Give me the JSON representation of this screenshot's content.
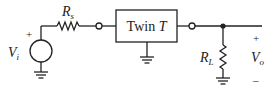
{
  "diagram": {
    "source": {
      "symbol": "V",
      "subscript": "i",
      "plus": "+"
    },
    "series_resistor": {
      "symbol": "R",
      "subscript": "s"
    },
    "block": {
      "label_text": "Twin ",
      "label_italic": "T"
    },
    "load_resistor": {
      "symbol": "R",
      "subscript": "L"
    },
    "output": {
      "symbol": "V",
      "subscript": "o",
      "plus": "+",
      "minus": "–"
    }
  }
}
